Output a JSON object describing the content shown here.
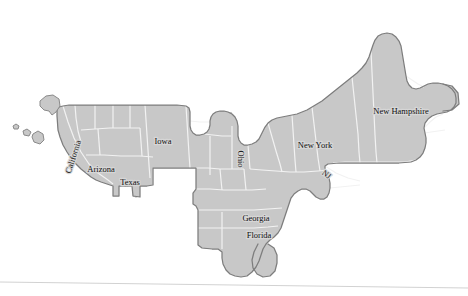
{
  "map": {
    "title": "United States cartogram map",
    "background_color": "#ffffff",
    "state_fill_color": "#c8c8c8",
    "state_fill_light": "#d0d0d0",
    "internal_border_color": "#ffffff",
    "outer_border_color": "#7d7d7d",
    "label_text_color": "#111111",
    "label_halo_color": "#d6d6d6",
    "baseline_rule_color": "#d2d2d2",
    "labels": [
      {
        "id": "california",
        "text": "California",
        "x": 74,
        "y": 157,
        "rotation": -72,
        "size": 8.5
      },
      {
        "id": "arizona",
        "text": "Arizona",
        "x": 101,
        "y": 170,
        "rotation": 0,
        "size": 8.5
      },
      {
        "id": "texas",
        "text": "Texas",
        "x": 130,
        "y": 183,
        "rotation": 0,
        "size": 8.5
      },
      {
        "id": "iowa",
        "text": "Iowa",
        "x": 163,
        "y": 142,
        "rotation": 0,
        "size": 8.5
      },
      {
        "id": "ohio",
        "text": "Ohio",
        "x": 240,
        "y": 159,
        "rotation": 90,
        "size": 8.5
      },
      {
        "id": "georgia",
        "text": "Georgia",
        "x": 256,
        "y": 219,
        "rotation": 0,
        "size": 8.5
      },
      {
        "id": "florida",
        "text": "Florida",
        "x": 259,
        "y": 236,
        "rotation": 0,
        "size": 8.5
      },
      {
        "id": "new-york",
        "text": "New York",
        "x": 315,
        "y": 146,
        "rotation": 0,
        "size": 8.5
      },
      {
        "id": "new-jersey",
        "text": "NJ",
        "x": 326,
        "y": 175,
        "rotation": 38,
        "size": 8
      },
      {
        "id": "new-hampshire",
        "text": "New Hampshire",
        "x": 401,
        "y": 112,
        "rotation": 0,
        "size": 8.5
      }
    ],
    "islands": [
      {
        "id": "island-a",
        "label": "small-island-far-west"
      },
      {
        "id": "island-b",
        "label": "small-island-west"
      },
      {
        "id": "island-c",
        "label": "island-mid"
      },
      {
        "id": "island-d",
        "label": "island-large-north"
      }
    ]
  }
}
